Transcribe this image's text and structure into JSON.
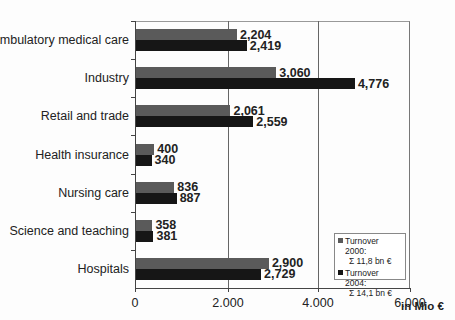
{
  "chart_data": {
    "type": "bar",
    "orientation": "horizontal",
    "title": "",
    "xlabel": "in Mio €",
    "ylabel": "",
    "xlim": [
      0,
      6000
    ],
    "x_ticks": [
      "0",
      "2.000",
      "4.000",
      "6.000"
    ],
    "grid": true,
    "legend_position": "lower right inside",
    "categories": [
      "Ambulatory medical care",
      "Industry",
      "Retail and trade",
      "Health insurance",
      "Nursing care",
      "Science and teaching",
      "Hospitals"
    ],
    "series": [
      {
        "name": "Turnover 2000",
        "total": "Σ 11,8 bn €",
        "color": "#5a5a5a",
        "values": [
          2204,
          3060,
          2061,
          400,
          836,
          358,
          2900
        ]
      },
      {
        "name": "Turnover 2004",
        "total": "Σ 14,1 bn €",
        "color": "#161616",
        "values": [
          2419,
          4776,
          2559,
          340,
          887,
          381,
          2729
        ]
      }
    ],
    "value_labels": {
      "s2000": [
        "2,204",
        "3,060",
        "2,061",
        "400",
        "836",
        "358",
        "2,900"
      ],
      "s2004": [
        "2,419",
        "4,776",
        "2,559",
        "340",
        "887",
        "381",
        "2,729"
      ]
    }
  },
  "axis": {
    "ticks": [
      "0",
      "2.000",
      "4.000",
      "6.000"
    ],
    "unit": "in Mio €"
  },
  "legend": {
    "s2000_label": "Turnover 2000:",
    "s2000_sum": "Σ 11,8 bn €",
    "s2004_label": "Turnover 2004:",
    "s2004_sum": "Σ 14,1 bn €"
  },
  "categories": [
    {
      "label": "Ambulatory medical care",
      "v2000": "2,204",
      "v2004": "2,419"
    },
    {
      "label": "Industry",
      "v2000": "3,060",
      "v2004": "4,776"
    },
    {
      "label": "Retail and trade",
      "v2000": "2,061",
      "v2004": "2,559"
    },
    {
      "label": "Health insurance",
      "v2000": "400",
      "v2004": "340"
    },
    {
      "label": "Nursing care",
      "v2000": "836",
      "v2004": "887"
    },
    {
      "label": "Science and teaching",
      "v2000": "358",
      "v2004": "381"
    },
    {
      "label": "Hospitals",
      "v2000": "2,900",
      "v2004": "2,729"
    }
  ]
}
